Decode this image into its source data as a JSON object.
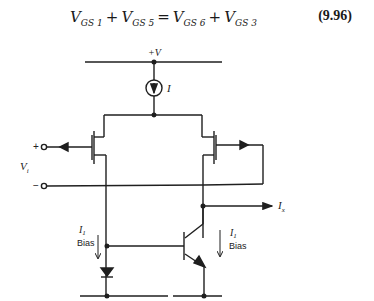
{
  "equation": {
    "terms": [
      {
        "symbol": "V",
        "subscript": "GS 1"
      },
      {
        "symbol": "V",
        "subscript": "GS 5"
      },
      {
        "symbol": "V",
        "subscript": "GS 6"
      },
      {
        "symbol": "V",
        "subscript": "GS 3"
      }
    ],
    "op_plus": "+",
    "op_equals": "=",
    "number": "(9.96)"
  },
  "circuit": {
    "supply_label": "+V",
    "current_source_label": "I",
    "input_plus": "+",
    "input_minus": "−",
    "input_label": "V",
    "input_label_sub": "i",
    "output_current_label": "I",
    "output_current_sub": "x",
    "bias_left": {
      "label": "I",
      "sub": "1",
      "text": "Bias"
    },
    "bias_right": {
      "label": "I",
      "sub": "1",
      "text": "Bias"
    },
    "line_color": "#1f1f1f"
  }
}
